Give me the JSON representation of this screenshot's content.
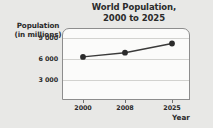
{
  "chart_data": {
    "type": "line",
    "title": "World Population,\n2000 to 2025",
    "title_line1": "World Population,",
    "title_line2": "2000 to 2025",
    "xlabel": "Year",
    "ylabel": "Population\n(in millions)",
    "ylabel_line1": "Population",
    "ylabel_line2": "(in millions)",
    "categories": [
      "2000",
      "2008",
      "2025"
    ],
    "x": [
      2000,
      2008,
      2025
    ],
    "values": [
      6100,
      6700,
      8000
    ],
    "ytick_labels": [
      "3 000",
      "6 000",
      "9 000"
    ],
    "yticks": [
      3000,
      6000,
      9000
    ],
    "ylim": [
      0,
      10200
    ],
    "grid": "horizontal",
    "legend": "none",
    "series": [
      {
        "name": "World population",
        "values": [
          6100,
          6700,
          8000
        ]
      }
    ],
    "marker": "filled-circle",
    "colors": {
      "line": "#3a3a3a",
      "marker": "#2b2b2b",
      "grid": "#d2d2cf",
      "frame": "#8d8d8d",
      "plot_background": "#fbfbfa",
      "page_background": "#e8e8e6",
      "text": "#2b2b2b"
    }
  }
}
